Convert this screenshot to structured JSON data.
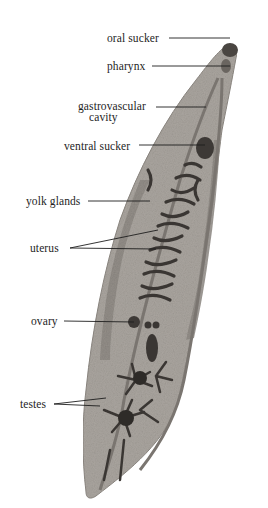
{
  "diagram": {
    "colors": {
      "background": "#ffffff",
      "body": "#a9a49e",
      "body_edge": "#8e8983",
      "yolk_glands": "#8f8a84",
      "organs_dark": "#3a3633",
      "leader_lines": "#1e1e1e",
      "text": "#1e1e1e"
    },
    "labels": [
      {
        "id": "oral-sucker",
        "text": "oral sucker"
      },
      {
        "id": "pharynx",
        "text": "pharynx"
      },
      {
        "id": "gastrovascular-cavity-line1",
        "text": "gastrovascular"
      },
      {
        "id": "gastrovascular-cavity-line2",
        "text": "cavity"
      },
      {
        "id": "ventral-sucker",
        "text": "ventral sucker"
      },
      {
        "id": "yolk-glands",
        "text": "yolk glands"
      },
      {
        "id": "uterus",
        "text": "uterus"
      },
      {
        "id": "ovary",
        "text": "ovary"
      },
      {
        "id": "testes",
        "text": "testes"
      }
    ]
  }
}
